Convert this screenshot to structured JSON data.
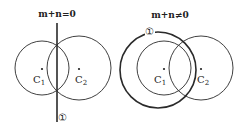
{
  "left_diagram": {
    "title": "m+n=0",
    "line_label": "①",
    "circle1_label": "C",
    "circle1_sub": "1",
    "circle2_label": "C",
    "circle2_sub": "2"
  },
  "right_diagram": {
    "title": "m+n≠0",
    "circle_label": "①",
    "circle1_label": "C",
    "circle1_sub": "1",
    "circle2_label": "C",
    "circle2_sub": "2"
  },
  "colors": {
    "stroke": "#2a2a2a",
    "background": "#ffffff"
  }
}
